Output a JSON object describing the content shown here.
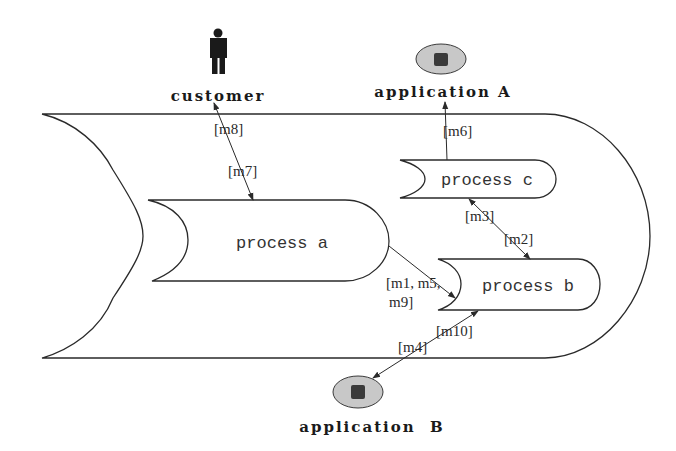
{
  "diagram": {
    "actors": {
      "customer": {
        "label": "customer",
        "icon": "person-icon"
      },
      "application_a": {
        "label": "application A",
        "icon": "application-icon"
      },
      "application_b": {
        "label": "application  B",
        "icon": "application-icon"
      }
    },
    "container": {
      "label": ""
    },
    "processes": {
      "a": {
        "label": "process a"
      },
      "b": {
        "label": "process b"
      },
      "c": {
        "label": "process c"
      }
    },
    "messages": {
      "m8": "[m8]",
      "m7": "[m7]",
      "m6": "[m6]",
      "m3": "[m3]",
      "m2": "[m2]",
      "m1_m5_line1": "[m1, m5,",
      "m1_m5_line2": "m9]",
      "m10": "[m10]",
      "m4": "[m4]"
    },
    "colors": {
      "stroke": "#2a2a2a",
      "app_fill": "#c8c8c8",
      "app_core": "#3a3a3a",
      "person": "#1a1a1a"
    }
  }
}
